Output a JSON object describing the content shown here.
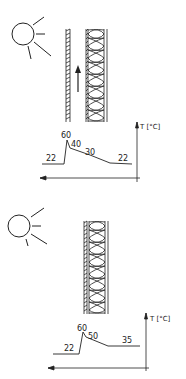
{
  "panels": [
    {
      "id": "ventilated",
      "sun": true,
      "air_flow_arrow": true,
      "axis_label": "T [°C]",
      "profile_labels": {
        "outside": "22",
        "peak": "60",
        "after_peak": "40",
        "mid": "30",
        "inside": "22"
      }
    },
    {
      "id": "non-ventilated",
      "sun": true,
      "air_flow_arrow": false,
      "axis_label": "T [°C]",
      "profile_labels": {
        "outside": "22",
        "peak": "60",
        "after_peak": "50",
        "inside": "35"
      }
    }
  ],
  "colors": {
    "line": "#222222",
    "background": "#ffffff"
  }
}
